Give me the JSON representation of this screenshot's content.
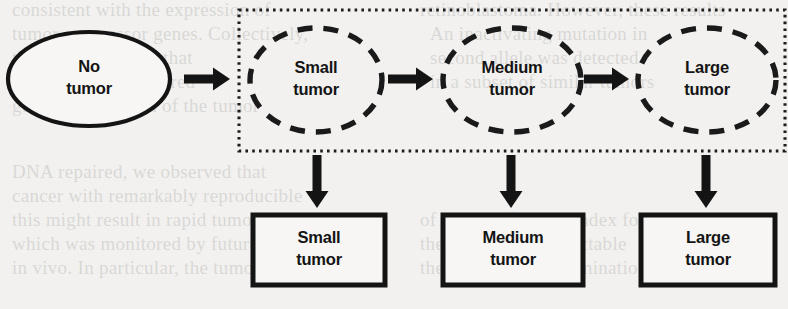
{
  "figure": {
    "type": "state-transition-diagram",
    "background_color": "#f2f1ef",
    "ink_color": "#141414",
    "canvas": {
      "width": 788,
      "height": 309
    }
  },
  "nodes": {
    "source": {
      "id": "no-tumor",
      "shape": "ellipse",
      "border_style": "solid",
      "line1": "No",
      "line2": "tumor",
      "cx": 89,
      "cy": 79,
      "rx": 81,
      "ry": 47
    },
    "hidden_states": [
      {
        "id": "small-tumor-state",
        "shape": "ellipse",
        "border_style": "dashed",
        "line1": "Small",
        "line2": "tumor",
        "cx": 316,
        "cy": 80,
        "rx": 66,
        "ry": 52
      },
      {
        "id": "medium-tumor-state",
        "shape": "ellipse",
        "border_style": "dashed",
        "line1": "Medium",
        "line2": "tumor",
        "cx": 512,
        "cy": 80,
        "rx": 69,
        "ry": 52
      },
      {
        "id": "large-tumor-state",
        "shape": "ellipse",
        "border_style": "dashed",
        "line1": "Large",
        "line2": "tumor",
        "cx": 707,
        "cy": 80,
        "rx": 69,
        "ry": 52
      }
    ],
    "observations": [
      {
        "id": "small-tumor-observation",
        "shape": "rectangle",
        "border_style": "solid",
        "line1": "Small",
        "line2": "tumor",
        "x": 253,
        "y": 215,
        "width": 132,
        "height": 70
      },
      {
        "id": "medium-tumor-observation",
        "shape": "rectangle",
        "border_style": "solid",
        "line1": "Medium",
        "line2": "tumor",
        "x": 443,
        "y": 215,
        "width": 140,
        "height": 70
      },
      {
        "id": "large-tumor-observation",
        "shape": "rectangle",
        "border_style": "solid",
        "line1": "Large",
        "line2": "tumor",
        "x": 641,
        "y": 215,
        "width": 134,
        "height": 70
      }
    ]
  },
  "group_box": {
    "id": "hidden-state-group",
    "border_style": "dotted",
    "x": 239,
    "y": 10,
    "width": 546,
    "height": 141
  },
  "arrows": {
    "horizontal": [
      {
        "id": "arrow-no-to-small",
        "from": "no-tumor",
        "to": "small-tumor-state",
        "x1": 184,
        "x2": 230,
        "y": 79
      },
      {
        "id": "arrow-small-to-medium",
        "from": "small-tumor-state",
        "to": "medium-tumor-state",
        "x1": 388,
        "x2": 433,
        "y": 79
      },
      {
        "id": "arrow-medium-to-large",
        "from": "medium-tumor-state",
        "to": "large-tumor-state",
        "x1": 584,
        "x2": 629,
        "y": 79
      }
    ],
    "vertical": [
      {
        "id": "arrow-small-state-to-observation",
        "x": 317,
        "y1": 155,
        "y2": 208
      },
      {
        "id": "arrow-medium-state-to-observation",
        "x": 511,
        "y1": 155,
        "y2": 208
      },
      {
        "id": "arrow-large-state-to-observation",
        "x": 706,
        "y1": 155,
        "y2": 208
      }
    ]
  },
  "background_bleed_text": {
    "note": "faint show-through text from the reverse side of the scanned page",
    "lines": [
      {
        "text": "consistent with the expression of",
        "x": 12,
        "y": 16
      },
      {
        "text": "tumor suppressor genes. Collectively,",
        "x": 12,
        "y": 40
      },
      {
        "text": "these data indicate that",
        "x": 12,
        "y": 64
      },
      {
        "text": "a second hit is required",
        "x": 12,
        "y": 88
      },
      {
        "text": "germline mutation of the tumor",
        "x": 12,
        "y": 112
      },
      {
        "text": "DNA repaired, we observed that",
        "x": 12,
        "y": 178
      },
      {
        "text": "cancer with remarkably reproducible",
        "x": 12,
        "y": 202
      },
      {
        "text": "this might result in rapid tumor",
        "x": 12,
        "y": 226
      },
      {
        "text": "which was monitored by future",
        "x": 12,
        "y": 250
      },
      {
        "text": "in vivo. In particular, the tumor growth",
        "x": 12,
        "y": 274
      },
      {
        "text": "retinoblastoma. However, these results",
        "x": 420,
        "y": 16
      },
      {
        "text": "An inactivating mutation in",
        "x": 430,
        "y": 40
      },
      {
        "text": "second allele was detected",
        "x": 430,
        "y": 64
      },
      {
        "text": "in a subset of similar tumors",
        "x": 430,
        "y": 88
      },
      {
        "text": "of the proliferative index for",
        "x": 420,
        "y": 226
      },
      {
        "text": "these small and detectable",
        "x": 420,
        "y": 250
      },
      {
        "text": "the microscopic examination",
        "x": 420,
        "y": 274
      }
    ]
  }
}
